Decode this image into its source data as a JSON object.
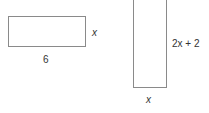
{
  "shapes": [
    {
      "name": "rectangle-a",
      "width_label": "6",
      "height_label": "x"
    },
    {
      "name": "rectangle-b",
      "width_label": "x",
      "height_label": "2x + 2"
    }
  ]
}
